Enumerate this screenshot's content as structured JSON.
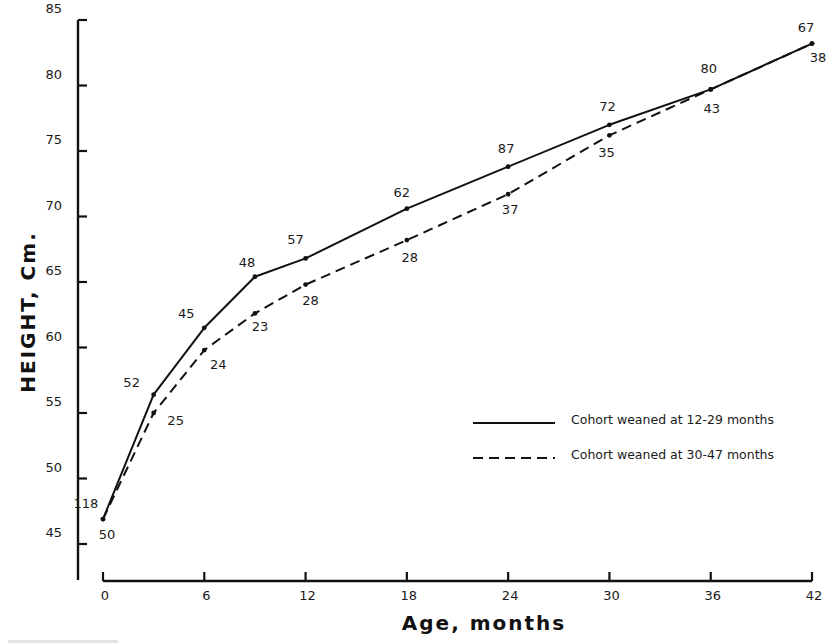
{
  "chart_data": {
    "type": "line",
    "title": "",
    "xlabel": "Age, months",
    "ylabel": "HEIGHT, Cm.",
    "xlim": [
      0,
      42
    ],
    "ylim": [
      45,
      85
    ],
    "x_ticks": [
      0,
      6,
      12,
      18,
      24,
      30,
      36,
      42
    ],
    "y_ticks": [
      45,
      50,
      55,
      60,
      65,
      70,
      75,
      80,
      85
    ],
    "grid": false,
    "legend_position": "lower right (inside plot)",
    "series": [
      {
        "name": "Cohort weaned at 12-29 months",
        "line_style": "solid",
        "x": [
          0,
          3,
          6,
          9,
          12,
          18,
          24,
          30,
          36,
          42
        ],
        "values": [
          46.9,
          56.4,
          61.5,
          65.4,
          66.8,
          70.6,
          73.8,
          77.0,
          79.7,
          83.2
        ],
        "point_labels": [
          "118",
          "52",
          "45",
          "48",
          "57",
          "62",
          "87",
          "72",
          "80",
          "67"
        ]
      },
      {
        "name": "Cohort weaned at 30-47 months",
        "line_style": "dashed",
        "x": [
          0,
          3,
          6,
          9,
          12,
          18,
          24,
          30,
          36,
          42
        ],
        "values": [
          46.9,
          55.0,
          59.8,
          62.6,
          64.8,
          68.2,
          71.7,
          76.2,
          79.7,
          83.2
        ],
        "point_labels": [
          "50",
          "25",
          "24",
          "23",
          "28",
          "28",
          "37",
          "35",
          "43",
          "38"
        ]
      }
    ],
    "annotations": "Numbers beside each point give sample sizes (n) per cohort at that age"
  },
  "legend": {
    "items": [
      {
        "label": "Cohort weaned at 12-29 months",
        "style": "solid"
      },
      {
        "label": "Cohort weaned at 30-47 months",
        "style": "dashed"
      }
    ]
  },
  "colors": {
    "ink": "#111111",
    "background": "#ffffff"
  }
}
